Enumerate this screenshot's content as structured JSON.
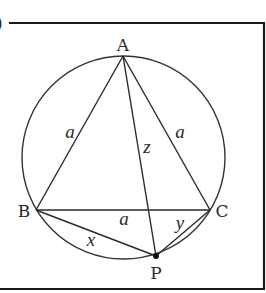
{
  "figure": {
    "panel_label_fragment": ")",
    "frame": {
      "left": 9,
      "top": 23,
      "right": 264,
      "bottom": 289,
      "stroke": "#1a1a1a"
    },
    "circle": {
      "cx": 123.5,
      "cy": 157.5,
      "r": 101.5,
      "stroke": "#333333"
    },
    "points": {
      "A": {
        "label": "A",
        "x": 123,
        "y": 56,
        "label_x": 123,
        "label_y": 51
      },
      "B": {
        "label": "B",
        "x": 36,
        "y": 210,
        "label_x": 24,
        "label_y": 217
      },
      "C": {
        "label": "C",
        "x": 210,
        "y": 210,
        "label_x": 222,
        "label_y": 217
      },
      "P": {
        "label": "P",
        "x": 156,
        "y": 256,
        "label_x": 156,
        "label_y": 278
      }
    },
    "segments": [
      {
        "from": "A",
        "to": "B"
      },
      {
        "from": "A",
        "to": "C"
      },
      {
        "from": "B",
        "to": "C"
      },
      {
        "from": "A",
        "to": "P"
      },
      {
        "from": "B",
        "to": "P"
      },
      {
        "from": "C",
        "to": "P"
      }
    ],
    "segment_labels": [
      {
        "text": "a",
        "x": 70,
        "y": 138,
        "refers_to": "AB"
      },
      {
        "text": "a",
        "x": 180,
        "y": 138,
        "refers_to": "AC"
      },
      {
        "text": "z",
        "x": 147,
        "y": 153,
        "refers_to": "AP"
      },
      {
        "text": "a",
        "x": 124,
        "y": 225,
        "refers_to": "BC"
      },
      {
        "text": "x",
        "x": 91,
        "y": 246,
        "refers_to": "BP"
      },
      {
        "text": "y",
        "x": 180,
        "y": 229,
        "refers_to": "CP"
      }
    ]
  }
}
